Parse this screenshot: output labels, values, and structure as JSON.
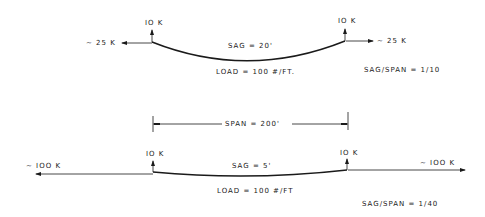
{
  "diagram": {
    "top_cable": {
      "left_vertical_reaction": "IO K",
      "right_vertical_reaction": "IO K",
      "left_horizontal_force": "~ 25 K",
      "right_horizontal_force": "~ 25 K",
      "sag": "SAG = 20'",
      "load": "LOAD = 100 #/FT.",
      "ratio": "SAG/SPAN = 1/10"
    },
    "span_dimension": "SPAN = 200'",
    "bottom_cable": {
      "left_vertical_reaction": "IO K",
      "right_vertical_reaction": "IO K",
      "left_horizontal_force": "~ IOO K",
      "right_horizontal_force": "~ IOO K",
      "sag": "SAG = 5'",
      "load": "LOAD = 100 #/FT",
      "ratio": "SAG/SPAN = 1/40"
    },
    "line_color": "#1a1a1a"
  }
}
